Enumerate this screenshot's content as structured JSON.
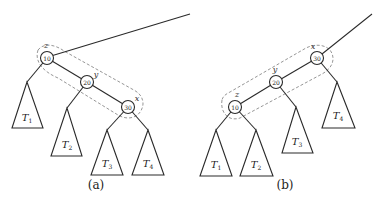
{
  "panels": [
    {
      "caption": "(a)",
      "nodes": [
        {
          "name": "z",
          "key": "10"
        },
        {
          "name": "y",
          "key": "20"
        },
        {
          "name": "x",
          "key": "30"
        }
      ],
      "subtrees": [
        {
          "label": "T",
          "sub": "1"
        },
        {
          "label": "T",
          "sub": "2"
        },
        {
          "label": "T",
          "sub": "3"
        },
        {
          "label": "T",
          "sub": "4"
        }
      ]
    },
    {
      "caption": "(b)",
      "nodes": [
        {
          "name": "x",
          "key": "30"
        },
        {
          "name": "y",
          "key": "20"
        },
        {
          "name": "z",
          "key": "10"
        }
      ],
      "subtrees": [
        {
          "label": "T",
          "sub": "1"
        },
        {
          "label": "T",
          "sub": "2"
        },
        {
          "label": "T",
          "sub": "3"
        },
        {
          "label": "T",
          "sub": "4"
        }
      ]
    }
  ],
  "colors": {
    "stroke": "#2a2a2a",
    "hull": "#8a8a8a",
    "background": "#ffffff"
  }
}
